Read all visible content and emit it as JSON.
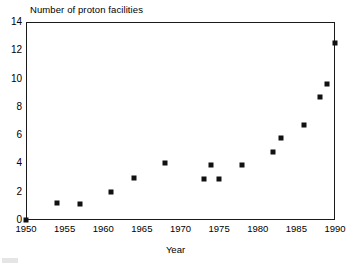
{
  "chart_data": {
    "type": "scatter",
    "title": "Number of proton facilities",
    "xlabel": "Year",
    "ylabel": "",
    "xlim": [
      1950,
      1990
    ],
    "ylim": [
      0,
      14
    ],
    "grid": false,
    "legend": null,
    "xticks": [
      1950,
      1955,
      1960,
      1965,
      1970,
      1975,
      1980,
      1985,
      1990
    ],
    "yticks": [
      0,
      2,
      4,
      6,
      8,
      10,
      12,
      14
    ],
    "marker": "filled-square",
    "marker_color": "#111111",
    "points": [
      {
        "x": 1950,
        "y": 0
      },
      {
        "x": 1954,
        "y": 1.2
      },
      {
        "x": 1957,
        "y": 1.1
      },
      {
        "x": 1961,
        "y": 2.0
      },
      {
        "x": 1964,
        "y": 3.0
      },
      {
        "x": 1968,
        "y": 4.0
      },
      {
        "x": 1973,
        "y": 2.9
      },
      {
        "x": 1974,
        "y": 3.9
      },
      {
        "x": 1975,
        "y": 2.9
      },
      {
        "x": 1978,
        "y": 3.9
      },
      {
        "x": 1982,
        "y": 4.8
      },
      {
        "x": 1983,
        "y": 5.8
      },
      {
        "x": 1986,
        "y": 6.7
      },
      {
        "x": 1988,
        "y": 8.7
      },
      {
        "x": 1989,
        "y": 9.6
      },
      {
        "x": 1990,
        "y": 12.5
      }
    ]
  },
  "axis": {
    "x_tick_labels": [
      "1950",
      "1955",
      "1960",
      "1965",
      "1970",
      "1975",
      "1980",
      "1985",
      "1990"
    ],
    "y_tick_labels": [
      "0",
      "2",
      "4",
      "6",
      "8",
      "10",
      "12",
      "14"
    ]
  },
  "colors": {
    "marker": "#111111",
    "frame": "#1a1a1a",
    "background": "#ffffff"
  }
}
